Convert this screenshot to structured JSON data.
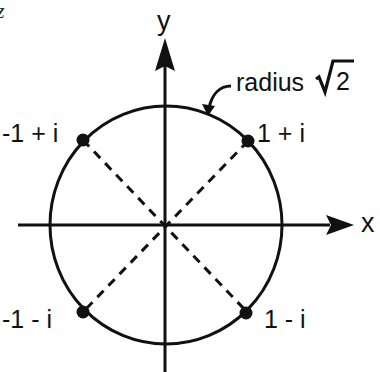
{
  "diagram": {
    "partial_glyph": "z",
    "axes": {
      "x_label": "x",
      "y_label": "y"
    },
    "circle": {
      "label_text": "radius",
      "label_math": "√2",
      "radical_content": "2",
      "radius_value": "√2"
    },
    "points": [
      {
        "label": "-1 + i",
        "re": -1,
        "im": 1
      },
      {
        "label": "1 + i",
        "re": 1,
        "im": 1
      },
      {
        "label": "-1 - i",
        "re": -1,
        "im": -1
      },
      {
        "label": "1 - i",
        "re": 1,
        "im": -1
      }
    ],
    "colors": {
      "stroke": "#111111",
      "background": "#ffffff"
    }
  }
}
